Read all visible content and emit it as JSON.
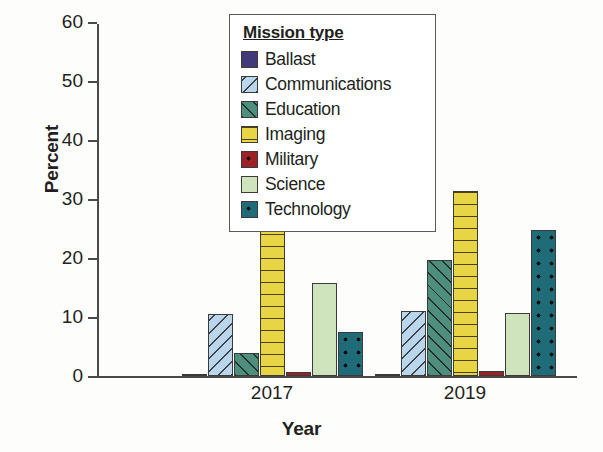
{
  "chart_data": {
    "type": "bar",
    "title": "",
    "xlabel": "Year",
    "ylabel": "Percent",
    "categories": [
      "2017",
      "2019"
    ],
    "ylim": [
      0,
      60
    ],
    "yticks": [
      0,
      10,
      20,
      30,
      40,
      50,
      60
    ],
    "grid": false,
    "legend_title": "Mission type",
    "legend_position": "upper center inside",
    "series": [
      {
        "name": "Ballast",
        "values": [
          0.0,
          0.4
        ],
        "color": "#413a78",
        "pattern": "solid"
      },
      {
        "name": "Communications",
        "values": [
          10.5,
          11.0
        ],
        "color": "#b9d6ed",
        "pattern": "diagonal-backward"
      },
      {
        "name": "Education",
        "values": [
          3.9,
          19.7
        ],
        "color": "#4e8e7d",
        "pattern": "diagonal-forward"
      },
      {
        "name": "Imaging",
        "values": [
          60.8,
          31.3
        ],
        "color": "#e8d545",
        "pattern": "horizontal-lines"
      },
      {
        "name": "Military",
        "values": [
          0.7,
          0.9
        ],
        "color": "#9c2226",
        "pattern": "dots"
      },
      {
        "name": "Science",
        "values": [
          15.8,
          10.7
        ],
        "color": "#cfe3bd",
        "pattern": "solid"
      },
      {
        "name": "Technology",
        "values": [
          7.5,
          24.8
        ],
        "color": "#1f6b78",
        "pattern": "dots"
      }
    ]
  },
  "axis": {
    "y_title": "Percent",
    "x_title": "Year",
    "y_tick_labels": [
      "0",
      "10",
      "20",
      "30",
      "40",
      "50",
      "60"
    ],
    "x_tick_labels": [
      "2017",
      "2019"
    ]
  },
  "legend": {
    "title": "Mission type",
    "items": [
      {
        "label": "Ballast"
      },
      {
        "label": "Communications"
      },
      {
        "label": "Education"
      },
      {
        "label": "Imaging"
      },
      {
        "label": "Military"
      },
      {
        "label": "Science"
      },
      {
        "label": "Technology"
      }
    ]
  },
  "colors": {
    "ballast": "#413a78",
    "communications": "#b9d6ed",
    "education": "#4e8e7d",
    "imaging": "#e8d545",
    "military": "#9c2226",
    "science": "#cfe3bd",
    "technology": "#1f6b78",
    "axis": "#4a4a4a",
    "text": "#231f20"
  }
}
